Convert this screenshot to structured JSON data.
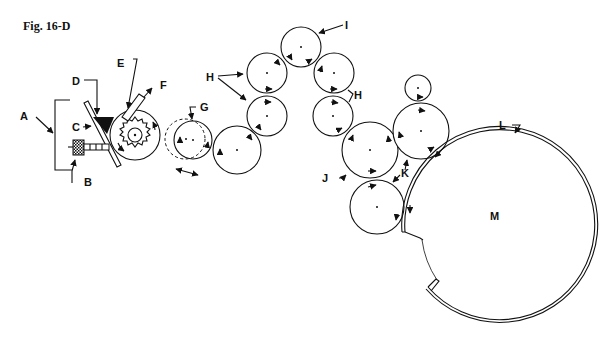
{
  "figure": {
    "title": "Fig. 16-D",
    "labels": {
      "A": "A",
      "B": "B",
      "C": "C",
      "D": "D",
      "E": "E",
      "F": "F",
      "G": "G",
      "H_left": "H",
      "H_right": "H",
      "I": "I",
      "J": "J",
      "K": "K",
      "L": "L",
      "M": "M"
    },
    "colors": {
      "line": "#111111",
      "background": "#ffffff"
    }
  }
}
